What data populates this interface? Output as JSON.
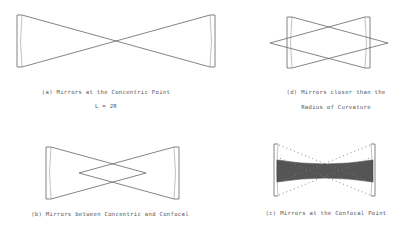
{
  "diagram": {
    "panels": [
      {
        "id": "a",
        "caption": "(a) Mirrors at the Concentric Point",
        "subcaption": "L = 2R"
      },
      {
        "id": "d",
        "caption": "(d) Mirrors closer than the",
        "subcaption": "Radius of Curvature"
      },
      {
        "id": "b",
        "caption": "(b) Mirrors between Concentric and Confocal"
      },
      {
        "id": "c",
        "caption": "(c) Mirrors at the Confocal Point"
      }
    ],
    "colors": {
      "line": "#666666",
      "beam_fill": "#555555",
      "background": "#ffffff"
    }
  }
}
